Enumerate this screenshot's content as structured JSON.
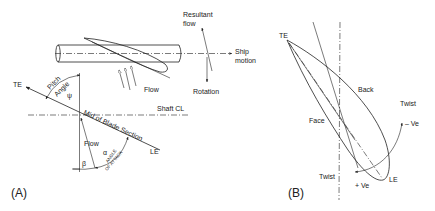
{
  "panel_a": {
    "tag": "(A)",
    "labels": {
      "resultant_flow_line1": "Resultant",
      "resultant_flow_line2": "flow",
      "ship_motion_line1": "Ship",
      "ship_motion_line2": "motion",
      "rotation": "Rotation",
      "flow_top": "Flow",
      "te": "TE",
      "le": "LE",
      "pitch": "Pitch",
      "angle": "Angle",
      "psi": "ψ",
      "shaft_cl": "Shaft CL",
      "mid_blade_section": "Mid of Blade Section",
      "flow_lower": "Flow",
      "alpha": "α",
      "beta": "β",
      "angle_of_attack_line1": "ANGLE",
      "angle_of_attack_line2": "OF ATTACK"
    }
  },
  "panel_b": {
    "tag": "(B)",
    "labels": {
      "te": "TE",
      "back": "Back",
      "twist_top": "Twist",
      "minus_ve": "– Ve",
      "face": "Face",
      "twist_bottom": "Twist",
      "plus_ve": "+ Ve",
      "le": "LE"
    }
  }
}
